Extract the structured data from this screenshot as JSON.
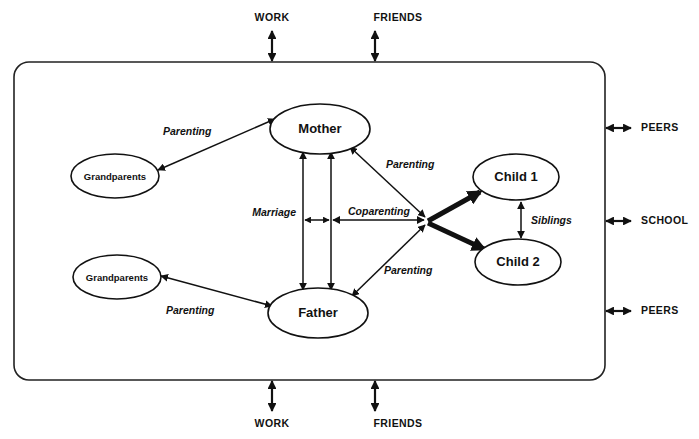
{
  "figure": {
    "type": "diagram",
    "subtype": "family-systems-model",
    "boundary": {
      "name": "family-system-boundary",
      "shape": "rounded-rectangle"
    }
  },
  "nodes": [
    {
      "id": "grandparents-maternal",
      "label": "Grandparents",
      "cx": 115,
      "cy": 176,
      "rx": 44,
      "ry": 22,
      "size": "small"
    },
    {
      "id": "mother",
      "label": "Mother",
      "cx": 320,
      "cy": 129,
      "rx": 50,
      "ry": 25,
      "size": "large"
    },
    {
      "id": "father",
      "label": "Father",
      "cx": 318,
      "cy": 313,
      "rx": 50,
      "ry": 25,
      "size": "large"
    },
    {
      "id": "grandparents-paternal",
      "label": "Grandparents",
      "cx": 117,
      "cy": 277,
      "rx": 44,
      "ry": 22,
      "size": "small"
    },
    {
      "id": "child-1",
      "label": "Child 1",
      "cx": 516,
      "cy": 177,
      "rx": 43,
      "ry": 23,
      "size": "large"
    },
    {
      "id": "child-2",
      "label": "Child 2",
      "cx": 518,
      "cy": 262,
      "rx": 43,
      "ry": 23,
      "size": "large"
    }
  ],
  "relationships": [
    {
      "id": "parenting-maternal-grandparents",
      "label": "Parenting",
      "label_x": 163,
      "label_y": 132,
      "from": "grandparents-maternal",
      "to": "mother",
      "arrow": "double",
      "weight": "normal"
    },
    {
      "id": "parenting-paternal-grandparents",
      "label": "Parenting",
      "label_x": 166,
      "label_y": 311,
      "from": "grandparents-paternal",
      "to": "father",
      "arrow": "double",
      "weight": "normal"
    },
    {
      "id": "marriage",
      "label": "Marriage",
      "label_x": 250,
      "label_y": 213,
      "from": "mother",
      "to": "father",
      "arrow": "double",
      "weight": "normal"
    },
    {
      "id": "coparenting",
      "label": "Coparenting",
      "label_x": 348,
      "label_y": 212,
      "from": "parents",
      "to": "coparenting-node",
      "arrow": "double",
      "weight": "normal"
    },
    {
      "id": "parenting-mother-child",
      "label": "Parenting",
      "label_x": 390,
      "label_y": 165,
      "from": "mother",
      "to": "coparenting-node",
      "arrow": "double",
      "weight": "normal"
    },
    {
      "id": "parenting-father-child",
      "label": "Parenting",
      "label_x": 388,
      "label_y": 271,
      "from": "father",
      "to": "coparenting-node",
      "arrow": "double",
      "weight": "normal"
    },
    {
      "id": "siblings",
      "label": "Siblings",
      "label_x": 530,
      "label_y": 221,
      "from": "child-1",
      "to": "child-2",
      "arrow": "double",
      "weight": "normal"
    },
    {
      "id": "coparenting-to-child-1",
      "label": "",
      "from": "coparenting-node",
      "to": "child-1",
      "arrow": "single",
      "weight": "thick"
    },
    {
      "id": "coparenting-to-child-2",
      "label": "",
      "from": "coparenting-node",
      "to": "child-2",
      "arrow": "single",
      "weight": "thick"
    }
  ],
  "external_contexts": [
    {
      "id": "work-top",
      "label": "WORK",
      "side": "top",
      "label_x": 272,
      "label_y": 18,
      "arrow_x": 272,
      "arrow_y1": 30,
      "arrow_y2": 62
    },
    {
      "id": "friends-top",
      "label": "FRIENDS",
      "side": "top",
      "label_x": 398,
      "label_y": 18,
      "arrow_x": 375,
      "arrow_y1": 30,
      "arrow_y2": 62
    },
    {
      "id": "peers-top-right",
      "label": "PEERS",
      "side": "right",
      "label_x": 634,
      "label_y": 128,
      "arrow_y": 128,
      "arrow_x1": 605,
      "arrow_x2": 628
    },
    {
      "id": "school-right",
      "label": "SCHOOL",
      "side": "right",
      "label_x": 634,
      "label_y": 221,
      "arrow_y": 221,
      "arrow_x1": 605,
      "arrow_x2": 628
    },
    {
      "id": "peers-bottom-right",
      "label": "PEERS",
      "side": "right",
      "label_x": 634,
      "label_y": 311,
      "arrow_y": 311,
      "arrow_x1": 605,
      "arrow_x2": 628
    },
    {
      "id": "work-bottom",
      "label": "WORK",
      "side": "bottom",
      "label_x": 272,
      "label_y": 424,
      "arrow_x": 272,
      "arrow_y1": 380,
      "arrow_y2": 412
    },
    {
      "id": "friends-bottom",
      "label": "FRIENDS",
      "side": "bottom",
      "label_x": 398,
      "label_y": 424,
      "arrow_x": 375,
      "arrow_y1": 380,
      "arrow_y2": 412
    }
  ],
  "colors": {
    "stroke": "#111111",
    "boundary": "#222222",
    "background": "#ffffff"
  }
}
